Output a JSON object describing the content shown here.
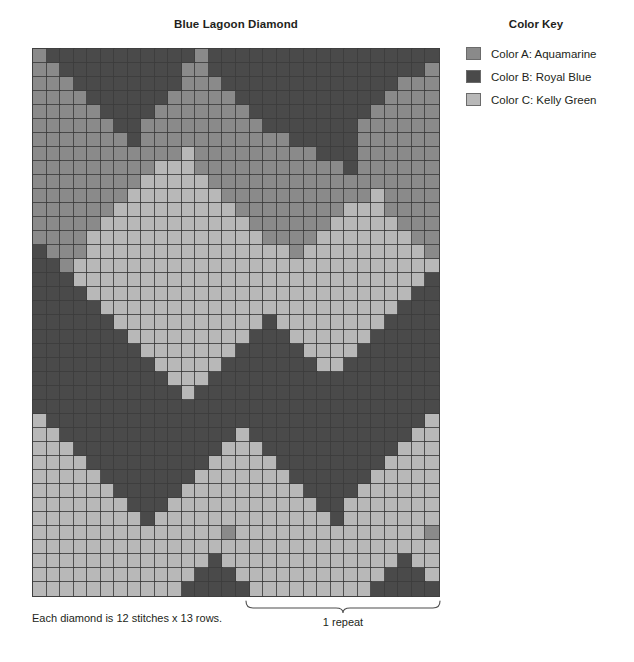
{
  "chart": {
    "title": "Blue Lagoon Diamond",
    "columns": 30,
    "rows": 39,
    "repeat_stitches": 12,
    "repeat_rows": 13,
    "colors": {
      "A": "#8a8a8a",
      "B": "#4a4a4a",
      "C": "#b8b8b8"
    },
    "gridline_color": "#3c3c3c"
  },
  "legend": {
    "title": "Color Key",
    "items": [
      {
        "key": "A",
        "swatch": "#8a8a8a",
        "label": "Color A: Aquamarine"
      },
      {
        "key": "B",
        "swatch": "#4a4a4a",
        "label": "Color B: Royal Blue"
      },
      {
        "key": "C",
        "swatch": "#b8b8b8",
        "label": "Color C: Kelly Green"
      }
    ]
  },
  "footnote": {
    "text": "Each diamond is 12 stitches x 13 rows."
  },
  "repeat": {
    "label": "1 repeat",
    "start_column": 15,
    "end_column": 30
  },
  "chart_data": {
    "type": "heatmap",
    "title": "Blue Lagoon Diamond",
    "xlabel": "",
    "ylabel": "",
    "legend_position": "right",
    "grid": true,
    "palette": {
      "A": "#8a8a8a",
      "B": "#4a4a4a",
      "C": "#b8b8b8"
    },
    "categories": [
      "A",
      "B",
      "C"
    ],
    "ncols": 30,
    "nrows": 39,
    "cells": [
      "ABBBBBBBBBBBABBBBBBBBBBBBBBBBB",
      "AABBBBBBBBBAABBBBBBBBBBBBBBBBA",
      "AAABBBBBBBBAAABBBBBBBBBBBBBAAA",
      "AAAABBBBBBAAAAABBBBBBBBBBBAAAA",
      "AAAAABBBBAAAAAAABBBBBBBBBAAAAA",
      "AAAAAABBAAAAAAAAABBBBBBBAAAAAA",
      "AAAAAAABAAAAAAAAAAABBBBBAAAAAA",
      "AAAAAAAAAAACAAAAAAAAABBBAAAAAA",
      "AAAAAAAAACCCAAAAAAAAAAABAAAAAA",
      "AAAAAAAACCCCCAAAAAAAAAAAAAAAAA",
      "AAAAAAACCCCCCCAAAAAAAAAAACAAAA",
      "AAAAAACCCCCCCCCAAAAAAAACCCAAAA",
      "AAAAACCCCCCCCCCCAAAAAACCCCCAAA",
      "AAAACCCCCCCCCCCCCAAAACCCCCCCAA",
      "BAAACCCCCCCCCCCCCCCACCCCCCCCCA",
      "BBACCCCCCCCCCCCCCCCCCCCCCCCCCC",
      "BBBCCCCCCCCCCCCCCCCCCCCCCCCCCB",
      "BBBBCCCCCCCCCCCCCCCCCCCCCCCCBB",
      "BBBBBCCCCCCCCCCCCCCCCCCCCCCBBB",
      "BBBBBBCCCCCCCCCCCBCCCCCCCCBBBB",
      "BBBBBBBCCCCCCCCCBBBCCCCCCBBBBB",
      "BBBBBBBBCCCCCCCBBBBBCCCCBBBBBB",
      "BBBBBBBBBCCCCCBBBBBBBCCBBBBBBB",
      "BBBBBBBBBBCCCBBBBBBBBBBBBBBBBB",
      "BBBBBBBBBBBCBBBBBBBBBBBBBBBBBB",
      "BBBBBBBBBBBBBBBBBBBBBBBBBBBBBB",
      "CBBBBBBBBBBBBBBBBBBBBBBBBBBBBC",
      "CCBBBBBBBBBBBBBCBBBBBBBBBBBBCC",
      "CCCBBBBBBBBBBBCCCBBBBBBBBBBCCC",
      "CCCCBBBBBBBBBCCCCCBBBBBBBBCCCC",
      "CCCCCBBBBBBBCCCCCCCBBBBBBCCCCC",
      "CCCCCCBBBBBCCCCCCCCCBBBBCCCCCC",
      "CCCCCCCBBBCCCCCCCCCCCBBCCCCCCC",
      "CCCCCCCCBCCCCCCCCCCCCCBCCCCCCC",
      "CCCCCCCCCCCCCCACCCCCCCCCCCCCCA",
      "CCCCCCCCCCCCCCCCCCCCCCCCCCCCCC",
      "CCCCCCCCCCCCCBCCCCCCCCCCCCCBCC",
      "CCCCCCCCCCCCBBBCCCCCCCCCCCBBBC",
      "CCCCCCCCCCCBBBBBCCCCCCCCCBBBBB"
    ]
  }
}
